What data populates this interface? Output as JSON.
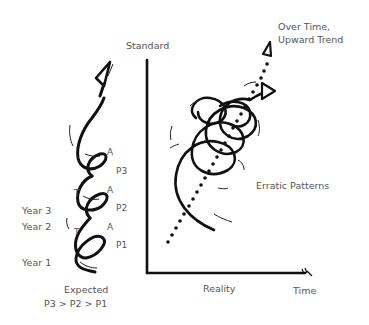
{
  "diagram": {
    "left_spiral": {
      "year_labels": [
        "Year 3",
        "Year 2",
        "Year 1"
      ],
      "loop_labels": {
        "a": [
          "A",
          "A",
          "A"
        ],
        "t": [
          "T",
          "T"
        ],
        "p": [
          "P3",
          "P2",
          "P1"
        ]
      },
      "caption_line1": "Expected",
      "caption_line2": "P3 > P2 > P1"
    },
    "chart": {
      "y_axis_label": "Standard",
      "x_axis_label": "Time",
      "x_caption": "Reality",
      "trend_label_line1": "Over Time,",
      "trend_label_line2": "Upward Trend",
      "pattern_label": "Erratic Patterns"
    },
    "colors": {
      "ink": "#111111",
      "text": "#555555",
      "background": "#ffffff"
    }
  }
}
